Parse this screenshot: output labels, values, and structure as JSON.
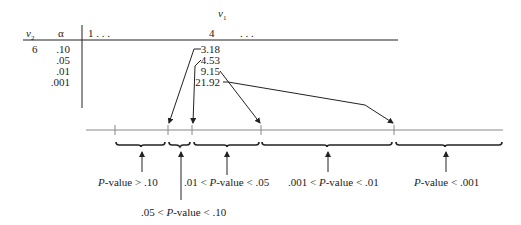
{
  "table": {
    "header": {
      "v1_label": "v",
      "v1_sub": "1",
      "v2_label": "v",
      "v2_sub": "2",
      "alpha_label": "α",
      "col_first": "1 . . .",
      "col_mid": "4",
      "col_dots": ". . ."
    },
    "row": {
      "v2": "6",
      "alphas": [
        ".10",
        ".05",
        ".01",
        ".001"
      ],
      "values": [
        "3.18",
        "4.53",
        "9.15",
        "21.92"
      ]
    }
  },
  "number_line": {
    "ticks_x": [
      115,
      168,
      192,
      261,
      394
    ]
  },
  "intervals": [
    {
      "p": "P",
      "label_pre": "",
      "label_post": "-value > .10"
    },
    {
      "p": "P",
      "label_pre": ".05 < ",
      "label_post": "-value < .10"
    },
    {
      "p": "P",
      "label_pre": ".01 < ",
      "label_post": "-value < .05"
    },
    {
      "p": "P",
      "label_pre": ".001 < ",
      "label_post": "-value < .01"
    },
    {
      "p": "P",
      "label_pre": "",
      "label_post": "-value < .001"
    }
  ]
}
